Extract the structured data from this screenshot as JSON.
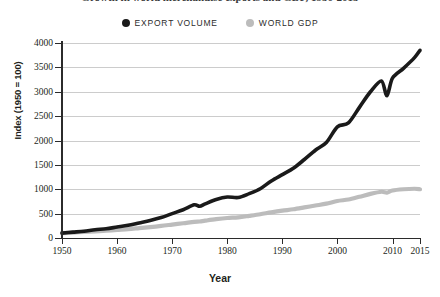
{
  "title_sliver": "Growth in world merchandise exports and GDP, 1950-2015",
  "legend": {
    "position": "top-center",
    "entries": [
      {
        "label": "EXPORT VOLUME",
        "color": "#1a1a1a",
        "marker": "filled-circle"
      },
      {
        "label": "WORLD GDP",
        "color": "#bcbcbc",
        "marker": "filled-circle"
      }
    ]
  },
  "axes": {
    "y_title": "Index (1950 = 100)",
    "x_title": "Year",
    "y_ticks": [
      0,
      500,
      1000,
      1500,
      2000,
      2500,
      3000,
      3500,
      4000
    ],
    "y_tick_labels": [
      "0",
      "500",
      "1000",
      "1500",
      "2000",
      "2500",
      "3000",
      "3500",
      "4000"
    ],
    "x_ticks": [
      1950,
      1960,
      1970,
      1980,
      1990,
      2000,
      2010,
      2015
    ],
    "x_tick_labels": [
      "1950",
      "1960",
      "1970",
      "1980",
      "1990",
      "2000",
      "2010",
      "2015"
    ]
  },
  "chart_data": {
    "type": "line",
    "title": "Growth in world merchandise exports and GDP, 1950-2015",
    "xlabel": "Year",
    "ylabel": "Index (1950 = 100)",
    "xlim": [
      1950,
      2015
    ],
    "ylim": [
      0,
      4000
    ],
    "grid": true,
    "legend_position": "top-center",
    "x": [
      1950,
      1952,
      1954,
      1956,
      1958,
      1960,
      1962,
      1964,
      1966,
      1968,
      1970,
      1972,
      1974,
      1975,
      1976,
      1978,
      1980,
      1982,
      1984,
      1986,
      1988,
      1990,
      1992,
      1994,
      1996,
      1998,
      2000,
      2002,
      2004,
      2006,
      2008,
      2009,
      2010,
      2012,
      2014,
      2015
    ],
    "series": [
      {
        "name": "EXPORT VOLUME",
        "color": "#1a1a1a",
        "values": [
          100,
          120,
          140,
          170,
          190,
          225,
          260,
          310,
          360,
          420,
          500,
          580,
          680,
          650,
          700,
          790,
          840,
          830,
          910,
          1010,
          1170,
          1300,
          1430,
          1610,
          1800,
          1960,
          2280,
          2360,
          2680,
          3000,
          3220,
          2920,
          3280,
          3480,
          3700,
          3850
        ]
      },
      {
        "name": "WORLD GDP",
        "color": "#bcbcbc",
        "values": [
          100,
          112,
          124,
          137,
          149,
          166,
          182,
          203,
          224,
          247,
          275,
          302,
          332,
          338,
          355,
          386,
          410,
          424,
          455,
          488,
          527,
          561,
          589,
          627,
          666,
          704,
          760,
          789,
          845,
          905,
          948,
          930,
          975,
          1000,
          1010,
          1000
        ]
      }
    ]
  }
}
